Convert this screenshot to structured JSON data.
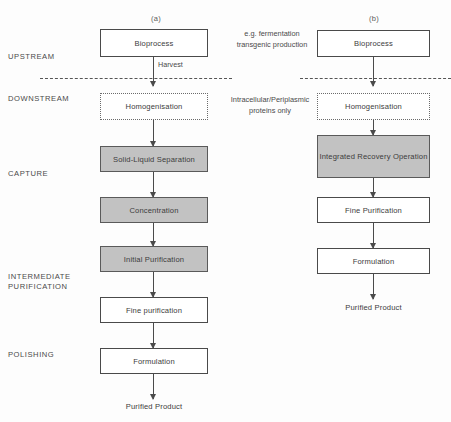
{
  "figure": {
    "columns": [
      {
        "id": "a",
        "label": "(a)"
      },
      {
        "id": "b",
        "label": "(b)"
      }
    ],
    "stage_labels": [
      {
        "key": "upstream",
        "text": "UPSTREAM"
      },
      {
        "key": "downstream",
        "text": "DOWNSTREAM"
      },
      {
        "key": "capture",
        "text": "CAPTURE"
      },
      {
        "key": "intermediate",
        "text": "INTERMEDIATE\nPURIFICATION"
      },
      {
        "key": "polishing",
        "text": "POLISHING"
      }
    ],
    "notes": [
      {
        "key": "upstream_note",
        "text": "e.g. fermentation\ntransgenic production"
      },
      {
        "key": "downstream_note",
        "text": "Intracellular/Periplasmic\nproteins only"
      }
    ],
    "arrow_labels": [
      {
        "key": "harvest",
        "text": "Harvest"
      }
    ],
    "column_a": {
      "nodes": [
        {
          "key": "bioprocess",
          "text": "Bioprocess",
          "style": "solid"
        },
        {
          "key": "homogenisation",
          "text": "Homogenisation",
          "style": "dotted"
        },
        {
          "key": "solid_liquid",
          "text": "Solid-Liquid Separation",
          "style": "shaded"
        },
        {
          "key": "concentration",
          "text": "Concentration",
          "style": "shaded"
        },
        {
          "key": "initial_purification",
          "text": "Initial Purification",
          "style": "shaded"
        },
        {
          "key": "fine_purification",
          "text": "Fine purification",
          "style": "solid"
        },
        {
          "key": "formulation",
          "text": "Formulation",
          "style": "solid"
        }
      ],
      "terminal": {
        "key": "purified_product",
        "text": "Purified Product"
      }
    },
    "column_b": {
      "nodes": [
        {
          "key": "bioprocess",
          "text": "Bioprocess",
          "style": "solid"
        },
        {
          "key": "homogenisation",
          "text": "Homogenisation",
          "style": "dotted"
        },
        {
          "key": "integrated_recovery",
          "text": "Integrated Recovery Operation",
          "style": "shaded"
        },
        {
          "key": "fine_purification",
          "text": "Fine Purification",
          "style": "solid"
        },
        {
          "key": "formulation",
          "text": "Formulation",
          "style": "solid"
        }
      ],
      "terminal": {
        "key": "purified_product",
        "text": "Purified Product"
      }
    },
    "colors": {
      "shaded_fill": "#c2c2c2",
      "stroke": "#4a4a4a",
      "background": "#fdfdfd",
      "text": "#3c3c3c"
    }
  }
}
